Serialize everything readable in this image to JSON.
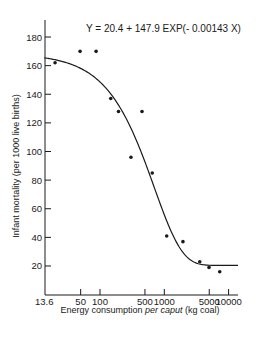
{
  "chart_data": {
    "type": "scatter",
    "title": "Y = 20.4 + 147.9 EXP(- 0.00143 X)",
    "equation": {
      "text": "Y=20.4+147.9 EXP(-0.00143X)",
      "a": 20.4,
      "b": 147.9,
      "k": 0.00143
    },
    "xlabel": "Energy consumption per caput (kg coal)",
    "xlabel_parts": [
      "Energy consumption ",
      "per caput",
      " (kg coal)"
    ],
    "ylabel": "Infant mortality (per 1000 live births)",
    "xscale": "log",
    "xlim": [
      13.6,
      14000
    ],
    "ylim": [
      0,
      190
    ],
    "x_ticks": [
      13.6,
      50,
      100,
      500,
      1000,
      5000,
      10000
    ],
    "x_tick_labels": [
      "13.6",
      "50",
      "100",
      "500",
      "1000",
      "5000",
      "10000"
    ],
    "y_ticks": [
      20,
      40,
      60,
      80,
      100,
      120,
      140,
      160,
      180
    ],
    "y_tick_labels": [
      "20",
      "40",
      "60",
      "80",
      "100",
      "120",
      "140",
      "160",
      "180"
    ],
    "grid": false,
    "legend": null,
    "series": [
      {
        "name": "Observed",
        "kind": "scatter",
        "points": [
          {
            "x": 20,
            "y": 162
          },
          {
            "x": 49,
            "y": 170
          },
          {
            "x": 87,
            "y": 170
          },
          {
            "x": 147,
            "y": 137
          },
          {
            "x": 194,
            "y": 128
          },
          {
            "x": 303,
            "y": 96
          },
          {
            "x": 450,
            "y": 128
          },
          {
            "x": 650,
            "y": 85
          },
          {
            "x": 1090,
            "y": 41
          },
          {
            "x": 1950,
            "y": 37
          },
          {
            "x": 3560,
            "y": 23
          },
          {
            "x": 4960,
            "y": 19
          },
          {
            "x": 7280,
            "y": 16
          }
        ]
      },
      {
        "name": "Fitted curve",
        "kind": "line",
        "x_range": [
          13.6,
          14000
        ]
      }
    ]
  }
}
